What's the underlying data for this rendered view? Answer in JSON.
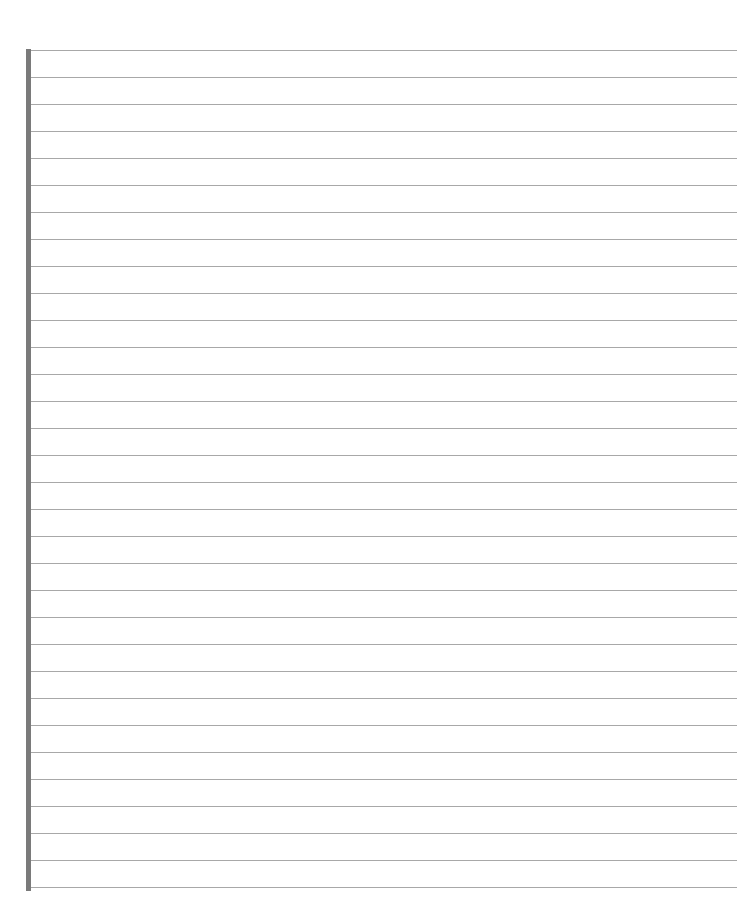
{
  "page": {
    "type": "lined-paper",
    "background_color": "#ffffff",
    "margin_bar_color": "#7a7a7a",
    "line_color": "#a8a8a8",
    "line_count": 32,
    "first_line_y": 50,
    "line_spacing": 27,
    "page_number": ""
  }
}
